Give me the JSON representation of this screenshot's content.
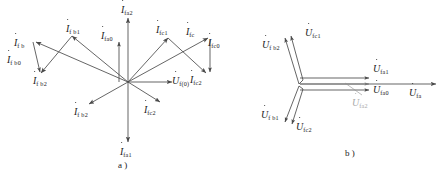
{
  "figure": {
    "background_color": "#ffffff",
    "line_color": "#4a4a4a",
    "text_color": "#1a1a1a",
    "faded_color": "#a8a8a8"
  },
  "panel_a": {
    "caption": "a )",
    "origin": {
      "x": 128,
      "y": 82
    },
    "labels": {
      "ifa2": {
        "symbol": "I",
        "sub": "fa2",
        "x": 121,
        "y": 5
      },
      "ifa0": {
        "symbol": "I",
        "sub": "fa0",
        "x": 101,
        "y": 31
      },
      "ifa1": {
        "symbol": "I",
        "sub": "fa1",
        "x": 120,
        "y": 147
      },
      "ifb": {
        "symbol": "I",
        "sub": "f b",
        "x": 14,
        "y": 38
      },
      "ifb0": {
        "symbol": "I",
        "sub": "f b0",
        "x": 7,
        "y": 55
      },
      "ifb1": {
        "symbol": "I",
        "sub": "f b1",
        "x": 66,
        "y": 24
      },
      "ifb2t": {
        "symbol": "I",
        "sub": "f b2",
        "x": 33,
        "y": 76
      },
      "ifb2b": {
        "symbol": "I",
        "sub": "f b2",
        "x": 74,
        "y": 107
      },
      "ifc": {
        "symbol": "I",
        "sub": "fc",
        "x": 186,
        "y": 27
      },
      "ifc0": {
        "symbol": "I",
        "sub": "fc0",
        "x": 208,
        "y": 38
      },
      "ifc1": {
        "symbol": "I",
        "sub": "fc1",
        "x": 156,
        "y": 25
      },
      "ifc2t": {
        "symbol": "I",
        "sub": "fc2",
        "x": 190,
        "y": 75
      },
      "ifc2b": {
        "symbol": "I",
        "sub": "fc2",
        "x": 144,
        "y": 105
      },
      "uf0": {
        "symbol": "U",
        "sub": "f(0)",
        "x": 172,
        "y": 76
      }
    }
  },
  "panel_b": {
    "caption": "b )",
    "labels": {
      "ufc1": {
        "symbol": "U",
        "sub": "fc1",
        "x": 305,
        "y": 28
      },
      "ufb2": {
        "symbol": "U",
        "sub": "f b2",
        "x": 273,
        "y": 40
      },
      "ufb1": {
        "symbol": "U",
        "sub": "f b1",
        "x": 272,
        "y": 110
      },
      "ufc2": {
        "symbol": "U",
        "sub": "fc2",
        "x": 306,
        "y": 120
      },
      "ufa1": {
        "symbol": "U",
        "sub": "fa1",
        "x": 375,
        "y": 63
      },
      "ufa0": {
        "symbol": "U",
        "sub": "fa0",
        "x": 375,
        "y": 82
      },
      "ufa2": {
        "symbol": "U",
        "sub": "fa2",
        "x": 355,
        "y": 98
      },
      "ufa": {
        "symbol": "U",
        "sub": "fa",
        "x": 410,
        "y": 84
      }
    }
  }
}
